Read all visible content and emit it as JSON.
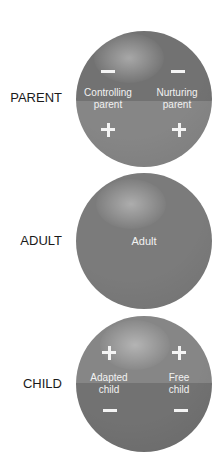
{
  "diagram": {
    "rows": [
      {
        "label": "PARENT",
        "type": "split",
        "top_sign": "minus",
        "bottom_sign": "plus",
        "left": {
          "line1": "Controlling",
          "line2": "parent"
        },
        "right": {
          "line1": "Nurturing",
          "line2": "parent"
        }
      },
      {
        "label": "ADULT",
        "type": "solid",
        "center_text": "Adult"
      },
      {
        "label": "CHILD",
        "type": "split",
        "top_sign": "plus",
        "bottom_sign": "minus",
        "left": {
          "line1": "Adapted",
          "line2": "child"
        },
        "right": {
          "line1": "Free",
          "line2": "child"
        }
      }
    ],
    "colors": {
      "circle_dark": "#727272",
      "circle_light": "#868686",
      "text": "#f2f2f2",
      "label": "#1a1a1a"
    }
  }
}
